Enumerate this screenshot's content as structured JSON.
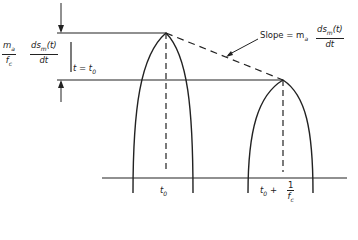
{
  "diagram": {
    "left_label": {
      "frac1_num": "m",
      "frac1_num_sub": "a",
      "frac1_den": "f",
      "frac1_den_sub": "c",
      "frac2_num": "ds",
      "frac2_num_sub": "m",
      "frac2_num_tail": "(t)",
      "frac2_den": "dt",
      "eval": "t = t",
      "eval_sub": "0"
    },
    "slope_label": {
      "prefix": "Slope = m",
      "prefix_sub": "a",
      "frac_num": "ds",
      "frac_num_sub": "m",
      "frac_num_tail": "(t)",
      "frac_den": "dt"
    },
    "axis_labels": {
      "t0": "t",
      "t0_sub": "0",
      "t1_prefix": "t",
      "t1_prefix_sub": "0",
      "t1_plus": "+",
      "t1_num": "1",
      "t1_den": "f",
      "t1_den_sub": "c"
    },
    "colors": {
      "line": "#222222",
      "background": "#ffffff"
    }
  }
}
